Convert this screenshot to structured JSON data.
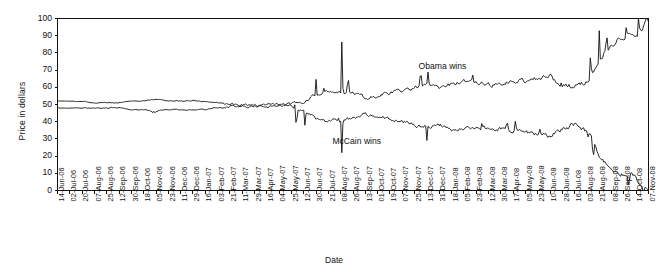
{
  "chart_data": {
    "type": "line",
    "title": "",
    "xlabel": "Date",
    "ylabel": "Price in dollars",
    "ylim": [
      0,
      100
    ],
    "yticks": [
      0,
      10,
      20,
      30,
      40,
      50,
      60,
      70,
      80,
      90,
      100
    ],
    "grid": false,
    "legend_position": "inline-annotation",
    "annotations": [
      {
        "text": "Obama wins",
        "x_date": "25-Nov-07",
        "y_value": 72
      },
      {
        "text": "McCain wins",
        "x_date": "21-Jul-07",
        "y_value": 28
      }
    ],
    "categories": [
      "14-Jun-06",
      "02-Jul-06",
      "20-Jul-06",
      "07-Aug-06",
      "25-Aug-06",
      "12-Sep-06",
      "30-Sep-06",
      "18-Oct-06",
      "05-Nov-06",
      "23-Nov-06",
      "11-Dec-06",
      "29-Dec-06",
      "16-Jan-07",
      "03-Feb-07",
      "21-Feb-07",
      "11-Mar-07",
      "29-Mar-07",
      "16-Apr-07",
      "04-May-07",
      "25-May-07",
      "12-Jun-07",
      "30-Jun-07",
      "21-Jul-07",
      "08-Aug-07",
      "26-Aug-07",
      "13-Sep-07",
      "01-Oct-07",
      "19-Oct-07",
      "07-Nov-07",
      "25-Nov-07",
      "13-Dec-07",
      "31-Dec-07",
      "18-Jan-08",
      "05-Feb-08",
      "23-Feb-08",
      "12-Mar-08",
      "30-Mar-08",
      "17-Apr-08",
      "05-May-08",
      "23-May-08",
      "10-Jun-08",
      "28-Jun-08",
      "16-Jul-08",
      "03-Aug-08",
      "21-Aug-08",
      "08-Sep-08",
      "26-Sep-08",
      "14-Oct-08",
      "07-Nov-08"
    ],
    "series": [
      {
        "name": "Obama wins",
        "color": "#111111",
        "values": [
          52,
          52,
          52,
          51,
          51,
          51,
          52,
          52,
          53,
          52,
          52,
          52,
          52,
          51,
          50,
          50,
          50,
          49,
          49,
          50,
          52,
          56,
          58,
          57,
          56,
          54,
          55,
          57,
          58,
          60,
          61,
          60,
          62,
          63,
          62,
          61,
          62,
          63,
          64,
          65,
          66,
          67,
          66,
          66,
          68,
          69,
          68,
          67,
          64
        ]
      },
      {
        "name": "McCain wins",
        "color": "#111111",
        "values": [
          48,
          48,
          48,
          48,
          48,
          48,
          47,
          47,
          46,
          47,
          47,
          47,
          47,
          48,
          49,
          49,
          49,
          50,
          50,
          49,
          46,
          42,
          40,
          41,
          42,
          44,
          43,
          41,
          40,
          38,
          37,
          38,
          36,
          35,
          36,
          37,
          36,
          35,
          34,
          33,
          32,
          31,
          32,
          32,
          30,
          29,
          30,
          31,
          34
        ]
      }
    ]
  }
}
